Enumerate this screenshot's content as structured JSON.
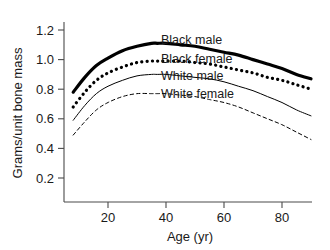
{
  "chart_data": {
    "type": "line",
    "title": "",
    "subtitle": "",
    "xlabel": "Age (yr)",
    "ylabel": "Grams/unit bone mass",
    "xlim": [
      0,
      95
    ],
    "ylim": [
      0,
      1.3
    ],
    "xticks": [
      20,
      40,
      60,
      80
    ],
    "xtick_labels": [
      "20",
      "40",
      "60",
      "80"
    ],
    "yticks": [
      0.2,
      0.4,
      0.6,
      0.8,
      1.0,
      1.2
    ],
    "ytick_labels": [
      "0.2",
      "0.4",
      "0.6",
      "0.8",
      "1.0",
      "1.2"
    ],
    "grid": false,
    "legend_position": "inline-right-of-curves",
    "x": [
      8,
      12,
      16,
      20,
      25,
      30,
      35,
      37,
      40,
      45,
      50,
      55,
      60,
      65,
      70,
      75,
      80,
      85,
      90
    ],
    "series": [
      {
        "name": "Black male",
        "style": "thick-solid",
        "color": "#000000",
        "label": "Black male",
        "values": [
          0.78,
          0.88,
          0.96,
          1.01,
          1.06,
          1.09,
          1.11,
          1.11,
          1.11,
          1.1,
          1.09,
          1.07,
          1.05,
          1.03,
          1.0,
          0.97,
          0.94,
          0.9,
          0.87
        ]
      },
      {
        "name": "Black female",
        "style": "thick-dotted",
        "color": "#000000",
        "label": "Black female",
        "values": [
          0.68,
          0.78,
          0.86,
          0.91,
          0.95,
          0.98,
          0.99,
          0.99,
          0.99,
          0.99,
          0.98,
          0.97,
          0.95,
          0.93,
          0.91,
          0.88,
          0.86,
          0.83,
          0.8
        ]
      },
      {
        "name": "White male",
        "style": "thin-solid",
        "color": "#000000",
        "label": "White male",
        "values": [
          0.59,
          0.69,
          0.77,
          0.82,
          0.86,
          0.89,
          0.9,
          0.9,
          0.9,
          0.89,
          0.88,
          0.87,
          0.85,
          0.82,
          0.79,
          0.75,
          0.71,
          0.66,
          0.62
        ]
      },
      {
        "name": "White female",
        "style": "thin-dashed",
        "color": "#000000",
        "label": "White female",
        "values": [
          0.49,
          0.58,
          0.66,
          0.71,
          0.75,
          0.77,
          0.77,
          0.77,
          0.77,
          0.76,
          0.75,
          0.73,
          0.71,
          0.68,
          0.64,
          0.6,
          0.56,
          0.51,
          0.46
        ]
      }
    ]
  },
  "axes": {
    "y_axis_title": "Grams/unit bone mass",
    "x_axis_title": "Age (yr)",
    "ytick_0": "0.2",
    "ytick_1": "0.4",
    "ytick_2": "0.6",
    "ytick_3": "0.8",
    "ytick_4": "1.0",
    "ytick_5": "1.2",
    "xtick_0": "20",
    "xtick_1": "40",
    "xtick_2": "60",
    "xtick_3": "80"
  },
  "labels": {
    "black_male": "Black male",
    "black_female": "Black female",
    "white_male": "White male",
    "white_female": "White female"
  },
  "colors": {
    "ink": "#000000",
    "axis": "#4a4a4a",
    "background": "#ffffff"
  }
}
